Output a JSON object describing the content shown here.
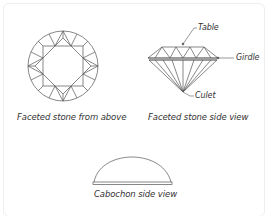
{
  "diagram": {
    "captions": {
      "top_view": "Faceted stone from above",
      "side_view": "Faceted stone side view",
      "cabochon": "Cabochon side view"
    },
    "callouts": {
      "table": "Table",
      "girdle": "Girdle",
      "culet": "Culet"
    },
    "colors": {
      "line": "#555555",
      "text": "#333333",
      "border": "#eeeeee"
    }
  }
}
